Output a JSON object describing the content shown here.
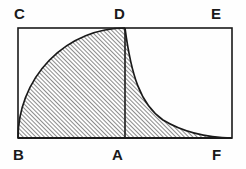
{
  "figure": {
    "background_color": "#fefefe",
    "stroke_color": "#1a1a1a",
    "hatch_color": "#2b2b2b",
    "labels": {
      "C": "C",
      "D": "D",
      "E": "E",
      "B": "B",
      "A": "A",
      "F": "F"
    },
    "points": {
      "B": {
        "x": 18,
        "y": 138
      },
      "C": {
        "x": 18,
        "y": 28
      },
      "D": {
        "x": 125,
        "y": 28
      },
      "E": {
        "x": 232,
        "y": 28
      },
      "A": {
        "x": 125,
        "y": 138
      },
      "F": {
        "x": 232,
        "y": 138
      }
    },
    "rectangle": {
      "left": 18,
      "top": 28,
      "right": 232,
      "bottom": 138,
      "width": 214,
      "height": 110,
      "stroke_width": 1.6
    },
    "segment_DA": {
      "from": "D",
      "to": "A",
      "x": 125,
      "y_top": 28,
      "y_bottom": 138,
      "stroke_width": 1.6
    },
    "left_curve": {
      "shape": "elliptical-arc",
      "description": "Concave-down arc rising from B at bottom-left to D at top",
      "center": {
        "x": 125,
        "y": 138
      },
      "radius_x": 107,
      "radius_y": 110,
      "path": "M 18 138 A 107 110 0 0 1 125 28"
    },
    "right_curve": {
      "shape": "hyperbolic-decay",
      "description": "Concave-up curve falling steeply from D and approaching the baseline near F",
      "from": "D",
      "to": "F",
      "path": "M 125 28 C 131 74 140 104 163 120 C 186 134 210 137.6 232 138"
    },
    "hatching": {
      "angle_degrees": 45,
      "spacing_px": 3,
      "line_width": 0.8,
      "direction": "bottom-left to top-right"
    },
    "hatched_region": {
      "description": "Region bounded above-left by the elliptical arc B-D, above-right by the curve D-F, and below by the baseline B-F",
      "path": "M 18 138 A 107 110 0 0 1 125 28 C 131 74 140 104 163 120 C 186 134 210 137.6 232 138 Z"
    }
  }
}
